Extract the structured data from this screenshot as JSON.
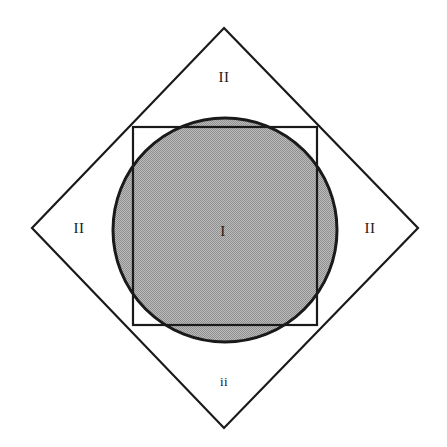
{
  "figure": {
    "canvas": {
      "width": 447,
      "height": 447,
      "background": "#ffffff"
    },
    "stroke_color": "#1a1a1a",
    "fill_gray": "#a8a8a8",
    "shapes": {
      "diamond": {
        "name": "rotated-square",
        "points": "224,28 418,228 224,428 32,228",
        "stroke_width": 2.2,
        "fill": "none"
      },
      "square": {
        "name": "axis-aligned-square",
        "x": 133,
        "y": 127,
        "width": 184,
        "height": 198,
        "stroke_width": 2.2,
        "fill": "none"
      },
      "circle": {
        "name": "inscribed-circle",
        "cx": 225,
        "cy": 230,
        "r": 112,
        "stroke_width": 3,
        "fill": "#a8a8a8"
      }
    },
    "labels": [
      {
        "id": "top",
        "text": "II",
        "x": 224,
        "y": 77
      },
      {
        "id": "left",
        "text": "II",
        "x": 79,
        "y": 228
      },
      {
        "id": "right",
        "text": "II",
        "x": 370,
        "y": 228
      },
      {
        "id": "center",
        "text": "I",
        "x": 223,
        "y": 231
      },
      {
        "id": "bottom",
        "text": "ii",
        "x": 224,
        "y": 381
      }
    ]
  }
}
